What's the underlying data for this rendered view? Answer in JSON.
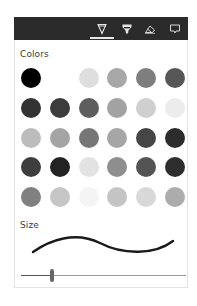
{
  "toolbar": {
    "background": "#2b2b2b",
    "tabs": [
      {
        "name": "ballpoint-pen",
        "icon": "pen-icon",
        "selected": true
      },
      {
        "name": "highlighter",
        "icon": "highlighter-icon",
        "selected": false
      },
      {
        "name": "eraser",
        "icon": "eraser-icon",
        "selected": false
      },
      {
        "name": "comment",
        "icon": "comment-icon",
        "selected": false
      }
    ]
  },
  "colors": {
    "label": "Colors",
    "swatches": [
      [
        "#000000",
        "#ffffff",
        "#dedede",
        "#a8a8a8",
        "#7e7e7e",
        "#575757"
      ],
      [
        "#333333",
        "#3c3c3c",
        "#5e5e5e",
        "#a2a2a2",
        "#cfcfcf",
        "#ececec"
      ],
      [
        "#bcbcbc",
        "#a4a4a4",
        "#767676",
        "#a6a6a6",
        "#464646",
        "#2c2c2c"
      ],
      [
        "#3e3e3e",
        "#232323",
        "#e2e2e2",
        "#8e8e8e",
        "#545454",
        "#2e2e2e"
      ],
      [
        "#808080",
        "#c6c6c6",
        "#f4f4f4",
        "#c4c4c4",
        "#d8d8d8",
        "#acacac"
      ]
    ]
  },
  "size": {
    "label": "Size",
    "preview_color": "#1a1a1a",
    "slider_value_percent": 19
  }
}
